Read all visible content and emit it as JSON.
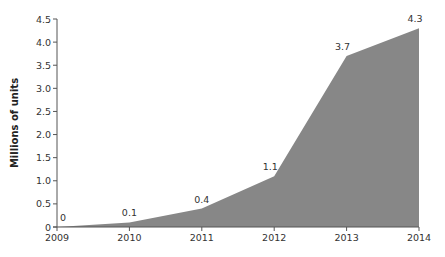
{
  "chart_data": {
    "type": "area",
    "title": "",
    "xlabel": "",
    "ylabel": "Millions of units",
    "categories": [
      "2009",
      "2010",
      "2011",
      "2012",
      "2013",
      "2014"
    ],
    "series": [
      {
        "name": "Units",
        "values": [
          0,
          0.1,
          0.4,
          1.1,
          3.7,
          4.3
        ]
      }
    ],
    "data_labels": [
      "0",
      "0.1",
      "0.4",
      "1.1",
      "3.7",
      "4.3"
    ],
    "ylim": [
      0,
      4.5
    ],
    "yticks": [
      "0",
      "0.5",
      "1.0",
      "1.5",
      "2.0",
      "2.5",
      "3.0",
      "3.5",
      "4.0",
      "4.5"
    ],
    "grid": false,
    "legend": "none",
    "colors": {
      "fill": "#878787",
      "axis": "#555555",
      "text": "#333333"
    }
  }
}
